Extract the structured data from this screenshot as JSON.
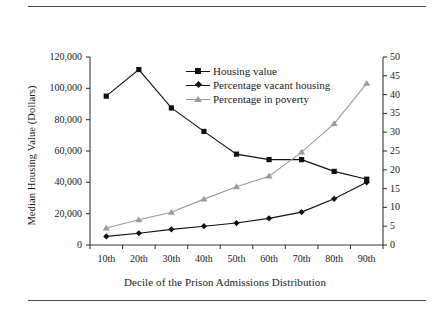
{
  "figure": {
    "rule_top": "horizontal-rule",
    "rule_bottom": "horizontal-rule"
  },
  "chart_data": {
    "type": "line",
    "title": "",
    "xlabel": "Decile of the Prison Admissions Distribution",
    "ylabel": "Median Housing Value (Dollars)",
    "ylabel_right": "Housing Units and Residents in Poverty (Percentage)",
    "categories": [
      "10th",
      "20th",
      "30th",
      "40th",
      "50th",
      "60th",
      "70th",
      "80th",
      "90th"
    ],
    "ylim": [
      0,
      120000
    ],
    "ylim_right": [
      0,
      50
    ],
    "yticks": [
      0,
      20000,
      40000,
      60000,
      80000,
      100000,
      120000
    ],
    "ytick_labels": [
      "0",
      "20,000",
      "40,000",
      "60,000",
      "80,000",
      "100,000",
      "120,000"
    ],
    "yticks_right": [
      0,
      5,
      10,
      15,
      20,
      25,
      30,
      35,
      40,
      45,
      50
    ],
    "ytick_labels_right": [
      "0",
      "5",
      "10",
      "15",
      "20",
      "25",
      "30",
      "35",
      "40",
      "45",
      "50"
    ],
    "grid": false,
    "legend_position": "upper-center",
    "series": [
      {
        "name": "Housing value",
        "axis": "left",
        "marker": "square",
        "color": "#111111",
        "values": [
          95000,
          112000,
          87500,
          72500,
          58000,
          54500,
          54500,
          47000,
          42000
        ]
      },
      {
        "name": "Percentage vacant housing",
        "axis": "left",
        "marker": "diamond",
        "color": "#111111",
        "values": [
          5500,
          7500,
          10000,
          12000,
          14000,
          17000,
          21000,
          29500,
          40000
        ]
      },
      {
        "name": "Percentage in poverty",
        "axis": "right",
        "marker": "triangle",
        "color": "#9a9a9a",
        "values": [
          4.5,
          6.7,
          8.7,
          12.2,
          15.5,
          18.3,
          24.7,
          32.3,
          43.0
        ]
      }
    ]
  }
}
